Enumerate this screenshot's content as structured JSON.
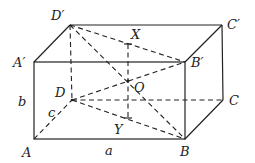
{
  "figure": {
    "type": "rectangular-box-diagram",
    "vertices": {
      "A": {
        "label": "A",
        "x": 34,
        "y": 139
      },
      "B": {
        "label": "B",
        "x": 185,
        "y": 139
      },
      "C": {
        "label": "C",
        "x": 223,
        "y": 100
      },
      "D": {
        "label": "D",
        "x": 72,
        "y": 100
      },
      "A1": {
        "label": "A′",
        "x": 34,
        "y": 62
      },
      "B1": {
        "label": "B′",
        "x": 185,
        "y": 62
      },
      "C1": {
        "label": "C′",
        "x": 222,
        "y": 25
      },
      "D1": {
        "label": "D′",
        "x": 70,
        "y": 25
      }
    },
    "points": {
      "X": {
        "label": "X",
        "x": 128,
        "y": 44
      },
      "O": {
        "label": "O",
        "x": 128,
        "y": 81
      },
      "Y": {
        "label": "Y",
        "x": 128,
        "y": 118
      }
    },
    "edge_labels": {
      "a": "a",
      "b": "b",
      "c": "c"
    }
  }
}
